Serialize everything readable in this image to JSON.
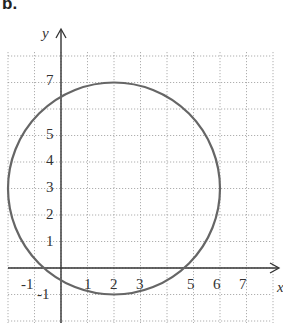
{
  "part_label": "b.",
  "axes": {
    "x_label": "x",
    "y_label": "y"
  },
  "x_ticks": [
    "-1",
    "1",
    "2",
    "3",
    "5",
    "6",
    "7"
  ],
  "y_ticks": [
    "7",
    "5",
    "4",
    "3",
    "2",
    "1",
    "-1"
  ],
  "chart_data": {
    "type": "diagram",
    "title": "",
    "circle": {
      "center": [
        2,
        3
      ],
      "radius": 4
    },
    "xlabel": "x",
    "ylabel": "y",
    "xlim": [
      -2,
      8
    ],
    "ylim": [
      -2,
      8
    ],
    "grid": true,
    "x_tick_labels": [
      -1,
      1,
      2,
      3,
      5,
      6,
      7
    ],
    "y_tick_labels": [
      7,
      5,
      4,
      3,
      2,
      1,
      -1
    ]
  },
  "colors": {
    "circle": "#666666",
    "grid": "#9a9a9a",
    "axis": "#333333"
  }
}
